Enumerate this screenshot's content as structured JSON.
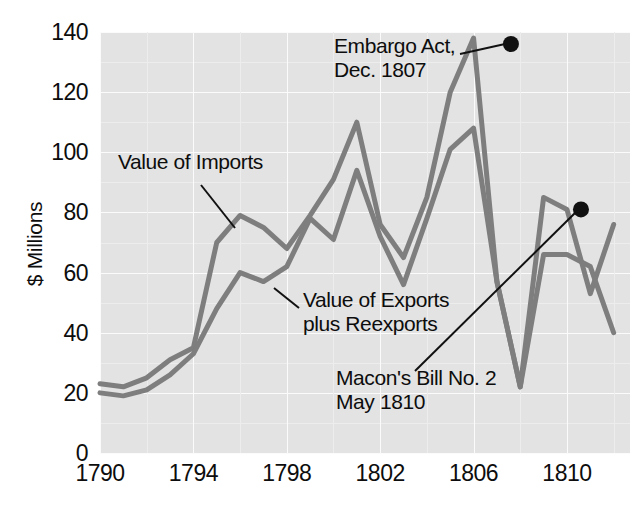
{
  "chart_data": {
    "type": "line",
    "title": "",
    "xlabel": "",
    "ylabel": "$ Millions",
    "xlim": [
      1790,
      1812.7
    ],
    "ylim": [
      0,
      140
    ],
    "grid": true,
    "legend": "inline-annotations",
    "x": [
      1790,
      1791,
      1792,
      1793,
      1794,
      1795,
      1796,
      1797,
      1798,
      1799,
      1800,
      1801,
      1802,
      1803,
      1804,
      1805,
      1806,
      1807,
      1808,
      1809,
      1810,
      1811,
      1812
    ],
    "series": [
      {
        "name": "Value of Imports",
        "color": "#7e7e7e",
        "values": [
          23,
          22,
          25,
          31,
          35,
          70,
          79,
          75,
          68,
          79,
          91,
          110,
          76,
          65,
          85,
          120,
          138,
          57,
          22,
          85,
          81,
          53,
          76
        ]
      },
      {
        "name": "Value of Exports plus Reexports",
        "color": "#7e7e7e",
        "values": [
          20,
          19,
          21,
          26,
          33,
          48,
          60,
          57,
          62,
          78,
          71,
          94,
          72,
          56,
          78,
          101,
          108,
          57,
          22,
          66,
          66,
          62,
          40
        ]
      }
    ],
    "markers": [
      {
        "label": "Embargo Act, Dec. 1807",
        "x": 1807.6,
        "y": 136
      },
      {
        "label": "Macon's Bill No. 2 May 1810",
        "x": 1810.6,
        "y": 81
      }
    ],
    "ytick_labels": [
      "140",
      "120",
      "100",
      "80",
      "60",
      "40",
      "20",
      "0"
    ],
    "ytick_values": [
      140,
      120,
      100,
      80,
      60,
      40,
      20,
      0
    ],
    "xtick_labels": [
      "1790",
      "1794",
      "1798",
      "1802",
      "1806",
      "1810"
    ],
    "xtick_values": [
      1790,
      1794,
      1798,
      1802,
      1806,
      1810
    ]
  },
  "axes": {
    "y_axis_title": "$ Millions"
  },
  "annotations": {
    "imports_label": "Value of Imports",
    "exports_label": "Value of Exports\nplus Reexports",
    "embargo_label": "Embargo Act,\nDec. 1807",
    "macon_label": "Macon's Bill No. 2\nMay 1810"
  },
  "colors": {
    "line": "#7e7e7e",
    "plot_background": "#e3e3e3",
    "gridline": "#fbfbfb",
    "marker": "#111111",
    "text": "#0d0d0d"
  }
}
